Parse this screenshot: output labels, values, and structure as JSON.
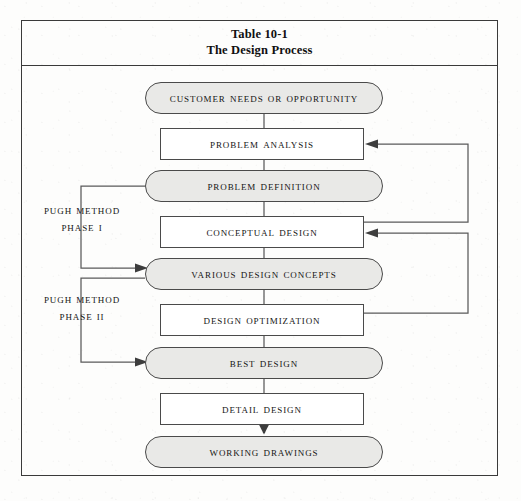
{
  "table": {
    "title_line1": "Table 10-1",
    "title_line2": "The Design Process"
  },
  "diagram": {
    "type": "flowchart",
    "colors": {
      "border": "#4a4a4a",
      "rounded_fill": "#e9e9e7",
      "rect_fill": "#ffffff",
      "text": "#141414",
      "frame": "#3a3a3a"
    },
    "nodes": [
      {
        "id": "customer-needs",
        "label": "Customer needs or opportunity",
        "shape": "rounded",
        "x": 124,
        "y": 16,
        "w": 238,
        "h": 32
      },
      {
        "id": "problem-analysis",
        "label": "Problem analysis",
        "shape": "rectangle",
        "x": 139,
        "y": 62,
        "w": 204,
        "h": 32
      },
      {
        "id": "problem-definition",
        "label": "Problem definition",
        "shape": "rounded",
        "x": 124,
        "y": 104,
        "w": 238,
        "h": 32
      },
      {
        "id": "conceptual-design",
        "label": "Conceptual design",
        "shape": "rectangle",
        "x": 139,
        "y": 150,
        "w": 204,
        "h": 32
      },
      {
        "id": "various-concepts",
        "label": "Various design concepts",
        "shape": "rounded",
        "x": 124,
        "y": 192,
        "w": 238,
        "h": 32
      },
      {
        "id": "design-optimization",
        "label": "Design optimization",
        "shape": "rectangle",
        "x": 139,
        "y": 238,
        "w": 204,
        "h": 32
      },
      {
        "id": "best-design",
        "label": "Best design",
        "shape": "rounded",
        "x": 124,
        "y": 281,
        "w": 238,
        "h": 32
      },
      {
        "id": "detail-design",
        "label": "Detail design",
        "shape": "rectangle",
        "x": 139,
        "y": 327,
        "w": 204,
        "h": 32
      },
      {
        "id": "working-drawings",
        "label": "Working drawings",
        "shape": "rounded",
        "x": 124,
        "y": 370,
        "w": 238,
        "h": 32
      }
    ],
    "phase_labels": [
      {
        "id": "pugh-phase-1",
        "line1": "Pugh method",
        "line2": "Phase I",
        "x": 18,
        "y": 140
      },
      {
        "id": "pugh-phase-2",
        "line1": "Pugh method",
        "line2": "Phase II",
        "x": 18,
        "y": 228
      }
    ],
    "connectors": [
      {
        "id": "customer-to-problem-analysis",
        "from": "customer-needs",
        "to": "problem-analysis",
        "kind": "vertical"
      },
      {
        "id": "problem-analysis-to-definition",
        "from": "problem-analysis",
        "to": "problem-definition",
        "kind": "vertical"
      },
      {
        "id": "definition-to-conceptual",
        "from": "problem-definition",
        "to": "conceptual-design",
        "kind": "vertical"
      },
      {
        "id": "conceptual-to-concepts",
        "from": "conceptual-design",
        "to": "various-concepts",
        "kind": "vertical"
      },
      {
        "id": "concepts-to-optimization",
        "from": "various-concepts",
        "to": "design-optimization",
        "kind": "vertical"
      },
      {
        "id": "optimization-to-best-design",
        "from": "design-optimization",
        "to": "best-design",
        "kind": "vertical"
      },
      {
        "id": "best-design-to-detail-design",
        "from": "best-design",
        "to": "detail-design",
        "kind": "vertical"
      },
      {
        "id": "detail-design-to-working-drawings",
        "from": "detail-design",
        "to": "working-drawings",
        "kind": "vertical-arrow"
      },
      {
        "id": "feedback-conceptual-to-analysis",
        "from": "conceptual-design",
        "to": "problem-analysis",
        "kind": "right-feedback-loop"
      },
      {
        "id": "feedback-optimization-to-conceptual",
        "from": "design-optimization",
        "to": "conceptual-design",
        "kind": "right-feedback-loop"
      },
      {
        "id": "phase1-bracket-to-concepts",
        "from": "problem-definition",
        "to": "various-concepts",
        "kind": "left-bracket-arrow"
      },
      {
        "id": "phase2-bracket-to-best-design",
        "from": "various-concepts",
        "to": "best-design",
        "kind": "left-bracket-arrow"
      }
    ]
  }
}
